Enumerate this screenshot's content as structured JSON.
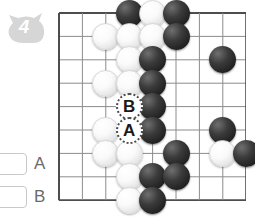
{
  "problem": {
    "number_badge": "4",
    "badge_shape": "cat-head-blob"
  },
  "answer_options": [
    {
      "id": "A",
      "label": "A",
      "checked": false
    },
    {
      "id": "B",
      "label": "B",
      "checked": false
    }
  ],
  "board": {
    "type": "go-board",
    "cols": 9,
    "rows": 9,
    "grid_spacing_px": 23.4,
    "origin_px": {
      "x": 58,
      "y": 12
    },
    "line_color": "#8c8c8c",
    "border_color": "#4d4d4d",
    "background": "#ffffff",
    "stone_colors": {
      "black": "#232323",
      "white": "#fafafa"
    },
    "stones": [
      {
        "col": 3,
        "row": 0,
        "color": "black"
      },
      {
        "col": 4,
        "row": 0,
        "color": "white"
      },
      {
        "col": 5,
        "row": 0,
        "color": "black"
      },
      {
        "col": 2,
        "row": 1,
        "color": "white"
      },
      {
        "col": 3,
        "row": 1,
        "color": "white"
      },
      {
        "col": 4,
        "row": 1,
        "color": "white"
      },
      {
        "col": 5,
        "row": 1,
        "color": "black"
      },
      {
        "col": 3,
        "row": 2,
        "color": "white"
      },
      {
        "col": 4,
        "row": 2,
        "color": "black"
      },
      {
        "col": 7,
        "row": 2,
        "color": "black"
      },
      {
        "col": 2,
        "row": 3,
        "color": "white"
      },
      {
        "col": 3,
        "row": 3,
        "color": "white"
      },
      {
        "col": 4,
        "row": 3,
        "color": "black"
      },
      {
        "col": 4,
        "row": 4,
        "color": "black"
      },
      {
        "col": 2,
        "row": 5,
        "color": "white"
      },
      {
        "col": 4,
        "row": 5,
        "color": "black"
      },
      {
        "col": 7,
        "row": 5,
        "color": "black"
      },
      {
        "col": 2,
        "row": 6,
        "color": "white"
      },
      {
        "col": 3,
        "row": 6,
        "color": "white"
      },
      {
        "col": 5,
        "row": 6,
        "color": "black"
      },
      {
        "col": 7,
        "row": 6,
        "color": "white"
      },
      {
        "col": 8,
        "row": 6,
        "color": "black"
      },
      {
        "col": 3,
        "row": 7,
        "color": "white"
      },
      {
        "col": 4,
        "row": 7,
        "color": "black"
      },
      {
        "col": 5,
        "row": 7,
        "color": "black"
      },
      {
        "col": 3,
        "row": 8,
        "color": "white"
      },
      {
        "col": 4,
        "row": 8,
        "color": "black"
      }
    ],
    "markers": [
      {
        "col": 3,
        "row": 4,
        "label": "B"
      },
      {
        "col": 3,
        "row": 5,
        "label": "A"
      }
    ]
  }
}
